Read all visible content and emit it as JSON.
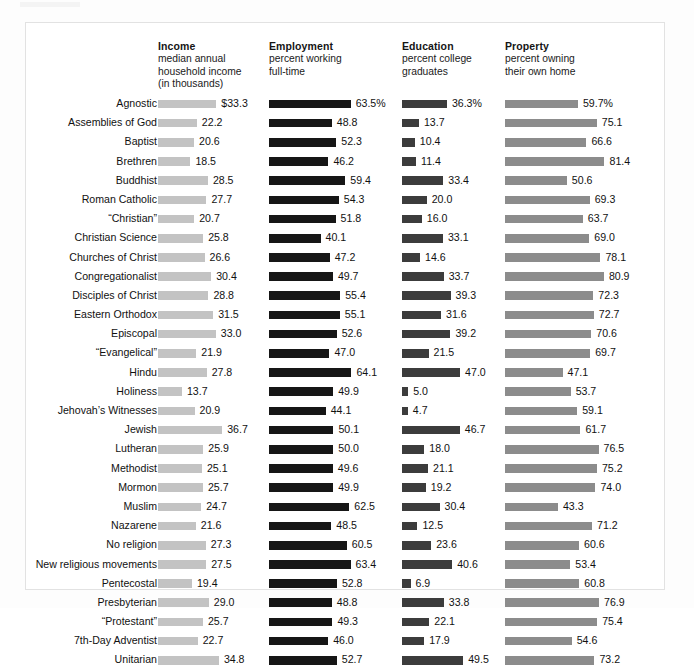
{
  "chart_data": {
    "type": "bar",
    "title": "",
    "subtitle": "",
    "orientation": "horizontal",
    "grid": false,
    "legend": "none",
    "xlabel": "",
    "ylabel": "",
    "categories": [
      "Agnostic",
      "Assemblies of God",
      "Baptist",
      "Brethren",
      "Buddhist",
      "Roman Catholic",
      "“Christian”",
      "Christian Science",
      "Churches of Christ",
      "Congregationalist",
      "Disciples of Christ",
      "Eastern Orthodox",
      "Episcopal",
      "“Evangelical”",
      "Hindu",
      "Holiness",
      "Jehovah’s Witnesses",
      "Jewish",
      "Lutheran",
      "Methodist",
      "Mormon",
      "Muslim",
      "Nazarene",
      "No religion",
      "New religious movements",
      "Pentecostal",
      "Presbyterian",
      "“Protestant”",
      "7th-Day Adventist",
      "Unitarian"
    ],
    "series": [
      {
        "name": "Income",
        "title": "Income",
        "subtitle": [
          "median annual",
          "household income",
          "(in thousands)"
        ],
        "unit": "thousands USD",
        "color": "#c3c3c3",
        "scale_max": 40,
        "values": [
          33.3,
          22.2,
          20.6,
          18.5,
          28.5,
          27.7,
          20.7,
          25.8,
          26.6,
          30.4,
          28.8,
          31.5,
          33.0,
          21.9,
          27.8,
          13.7,
          20.9,
          36.7,
          25.9,
          25.1,
          25.7,
          24.7,
          21.6,
          27.3,
          27.5,
          19.4,
          29.0,
          25.7,
          22.7,
          34.8
        ],
        "labels": [
          "$33.3",
          "22.2",
          "20.6",
          "18.5",
          "28.5",
          "27.7",
          "20.7",
          "25.8",
          "26.6",
          "30.4",
          "28.8",
          "31.5",
          "33.0",
          "21.9",
          "27.8",
          "13.7",
          "20.9",
          "36.7",
          "25.9",
          "25.1",
          "25.7",
          "24.7",
          "21.6",
          "27.3",
          "27.5",
          "19.4",
          "29.0",
          "25.7",
          "22.7",
          "34.8"
        ]
      },
      {
        "name": "Employment",
        "title": "Employment",
        "subtitle": [
          "percent working",
          "full-time"
        ],
        "unit": "percent",
        "color": "#161616",
        "scale_max": 70,
        "values": [
          63.5,
          48.8,
          52.3,
          46.2,
          59.4,
          54.3,
          51.8,
          40.1,
          47.2,
          49.7,
          55.4,
          55.1,
          52.6,
          47.0,
          64.1,
          49.9,
          44.1,
          50.1,
          50.0,
          49.6,
          49.9,
          62.5,
          48.5,
          60.5,
          63.4,
          52.8,
          48.8,
          49.3,
          46.0,
          52.7
        ],
        "labels": [
          "63.5%",
          "48.8",
          "52.3",
          "46.2",
          "59.4",
          "54.3",
          "51.8",
          "40.1",
          "47.2",
          "49.7",
          "55.4",
          "55.1",
          "52.6",
          "47.0",
          "64.1",
          "49.9",
          "44.1",
          "50.1",
          "50.0",
          "49.6",
          "49.9",
          "62.5",
          "48.5",
          "60.5",
          "63.4",
          "52.8",
          "48.8",
          "49.3",
          "46.0",
          "52.7"
        ]
      },
      {
        "name": "Education",
        "title": "Education",
        "subtitle": [
          "percent college",
          "graduates"
        ],
        "unit": "percent",
        "color": "#3c3c3c",
        "scale_max": 55,
        "values": [
          36.3,
          13.7,
          10.4,
          11.4,
          33.4,
          20.0,
          16.0,
          33.1,
          14.6,
          33.7,
          39.3,
          31.6,
          39.2,
          21.5,
          47.0,
          5.0,
          4.7,
          46.7,
          18.0,
          21.1,
          19.2,
          30.4,
          12.5,
          23.6,
          40.6,
          6.9,
          33.8,
          22.1,
          17.9,
          49.5
        ],
        "labels": [
          "36.3%",
          "13.7",
          "10.4",
          "11.4",
          "33.4",
          "20.0",
          "16.0",
          "33.1",
          "14.6",
          "33.7",
          "39.3",
          "31.6",
          "39.2",
          "21.5",
          "47.0",
          "5.0",
          "4.7",
          "46.7",
          "18.0",
          "21.1",
          "19.2",
          "30.4",
          "12.5",
          "23.6",
          "40.6",
          "6.9",
          "33.8",
          "22.1",
          "17.9",
          "49.5"
        ]
      },
      {
        "name": "Property",
        "title": "Property",
        "subtitle": [
          "percent owning",
          "their own home"
        ],
        "unit": "percent",
        "color": "#8c8c8c",
        "scale_max": 90,
        "values": [
          59.7,
          75.1,
          66.6,
          81.4,
          50.6,
          69.3,
          63.7,
          69.0,
          78.1,
          80.9,
          72.3,
          72.7,
          70.6,
          69.7,
          47.1,
          53.7,
          59.1,
          61.7,
          76.5,
          75.2,
          74.0,
          43.3,
          71.2,
          60.6,
          53.4,
          60.8,
          76.9,
          75.4,
          54.6,
          73.2
        ],
        "labels": [
          "59.7%",
          "75.1",
          "66.6",
          "81.4",
          "50.6",
          "69.3",
          "63.7",
          "69.0",
          "78.1",
          "80.9",
          "72.3",
          "72.7",
          "70.6",
          "69.7",
          "47.1",
          "53.7",
          "59.1",
          "61.7",
          "76.5",
          "75.2",
          "74.0",
          "43.3",
          "71.2",
          "60.6",
          "53.4",
          "60.8",
          "76.9",
          "75.4",
          "54.6",
          "73.2"
        ]
      }
    ]
  }
}
